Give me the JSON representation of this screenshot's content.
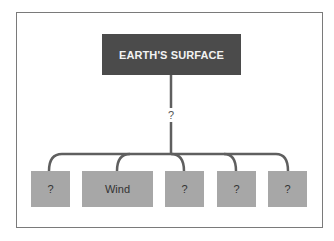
{
  "diagram": {
    "root": {
      "label": "EARTH'S SURFACE"
    },
    "connector_label": "?",
    "children": [
      {
        "label": "?"
      },
      {
        "label": "Wind"
      },
      {
        "label": "?"
      },
      {
        "label": "?"
      },
      {
        "label": "?"
      }
    ],
    "colors": {
      "root_fill": "#4b4b4b",
      "root_text": "#f2f2f2",
      "child_fill": "#a7a7a7",
      "connector": "#5f5f5f",
      "frame_border": "#7a7a7a"
    }
  }
}
